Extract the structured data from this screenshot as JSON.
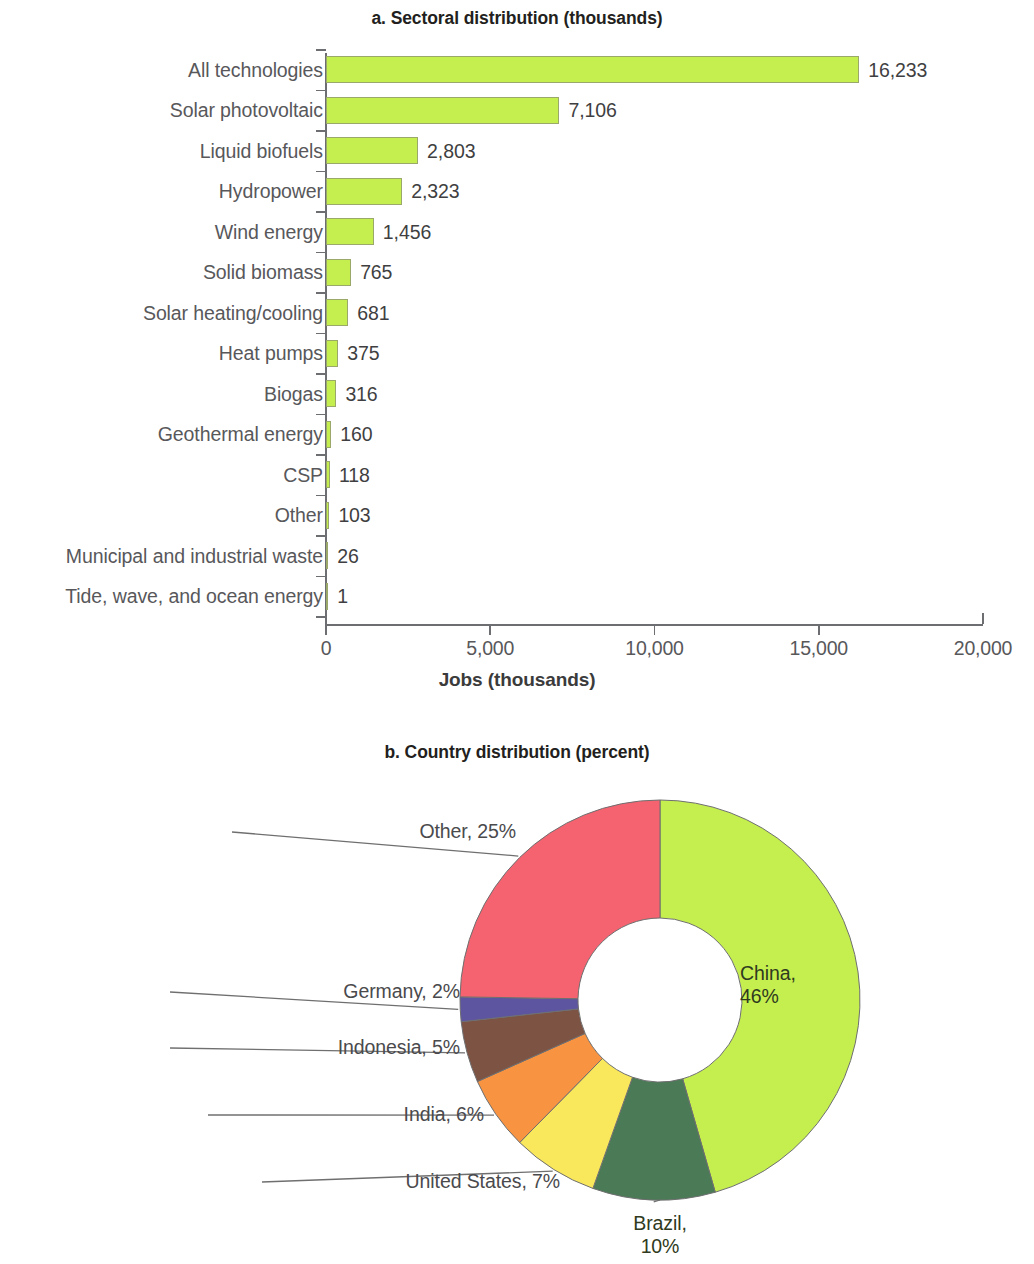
{
  "figure": {
    "panel_a_title": "a. Sectoral distribution (thousands)",
    "panel_b_title": "b. Country distribution (percent)"
  },
  "chart_data": [
    {
      "type": "bar",
      "orientation": "horizontal",
      "title": "a. Sectoral distribution (thousands)",
      "xlabel": "Jobs (thousands)",
      "ylabel": "",
      "xlim": [
        0,
        20000
      ],
      "xticks": [
        0,
        5000,
        10000,
        15000,
        20000
      ],
      "xticklabels": [
        "0",
        "5,000",
        "10,000",
        "15,000",
        "20,000"
      ],
      "grid": false,
      "legend": "none",
      "bar_color": "#c5ee4f",
      "bar_border_color": "#9aa86a",
      "categories": [
        "All technologies",
        "Solar photovoltaic",
        "Liquid biofuels",
        "Hydropower",
        "Wind energy",
        "Solid biomass",
        "Solar heating/cooling",
        "Heat pumps",
        "Biogas",
        "Geothermal energy",
        "CSP",
        "Other",
        "Municipal and industrial waste",
        "Tide, wave, and ocean energy"
      ],
      "values": [
        16233,
        7106,
        2803,
        2323,
        1456,
        765,
        681,
        375,
        316,
        160,
        118,
        103,
        26,
        1
      ],
      "value_labels": [
        "16,233",
        "7,106",
        "2,803",
        "2,323",
        "1,456",
        "765",
        "681",
        "375",
        "316",
        "160",
        "118",
        "103",
        "26",
        "1"
      ]
    },
    {
      "type": "pie",
      "variant": "donut",
      "title": "b. Country distribution (percent)",
      "unit": "percent",
      "start_angle_deg": 0,
      "direction": "clockwise",
      "labels": [
        "China",
        "Brazil",
        "United States",
        "India",
        "Indonesia",
        "Germany",
        "Other"
      ],
      "values": [
        46,
        10,
        7,
        6,
        5,
        2,
        25
      ],
      "colors": [
        "#c5ee4f",
        "#4b7a57",
        "#fae85c",
        "#f89441",
        "#7d5344",
        "#5d55a0",
        "#f4636f"
      ],
      "slice_labels": [
        {
          "text": "China,\n46%",
          "line1": "China,",
          "line2": "46%",
          "placement": "inside"
        },
        {
          "text": "Brazil, 10%",
          "line1": "Brazil,",
          "line2": "10%",
          "placement": "outside-bottom"
        },
        {
          "text": "United States, 7%",
          "placement": "outside-left"
        },
        {
          "text": "India, 6%",
          "placement": "outside-left"
        },
        {
          "text": "Indonesia, 5%",
          "placement": "outside-left"
        },
        {
          "text": "Germany, 2%",
          "placement": "outside-left"
        },
        {
          "text": "Other, 25%",
          "placement": "outside-left"
        }
      ]
    }
  ]
}
